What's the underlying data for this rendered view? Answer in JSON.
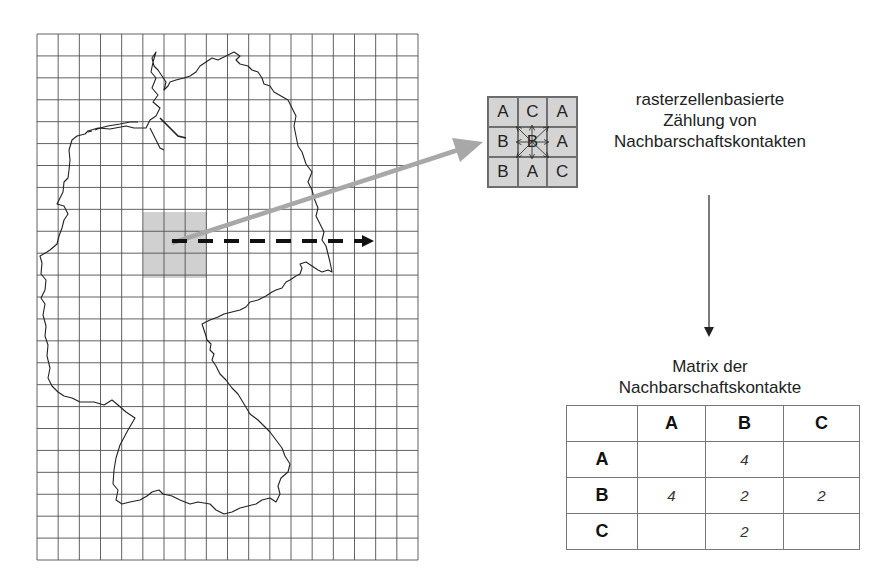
{
  "diagram": {
    "map": {
      "region": "Germany",
      "grid": {
        "columns": 18,
        "rows": 24,
        "line_color": "#555555"
      },
      "highlighted_block": {
        "columns": 3,
        "rows": 3,
        "fill": "#d0d0d0"
      },
      "scan_arrow": {
        "style": "dashed",
        "direction": "right",
        "color": "#111111"
      },
      "zoom_arrow": {
        "color": "#a8a8a8"
      }
    },
    "neighborhood": {
      "cells": [
        [
          "A",
          "C",
          "A"
        ],
        [
          "B",
          "B",
          "A"
        ],
        [
          "B",
          "A",
          "C"
        ]
      ],
      "fill": "#d4d4d4"
    },
    "counting_label": {
      "lines": [
        "rasterzellenbasierte",
        "Zählung von",
        "Nachbarschaftskontakten"
      ]
    },
    "matrix_label": {
      "lines": [
        "Matrix der",
        "Nachbarschaftskontakte"
      ]
    },
    "matrix": {
      "columns": [
        "",
        "A",
        "B",
        "C"
      ],
      "rows": [
        {
          "label": "A",
          "values": [
            "",
            "4",
            ""
          ]
        },
        {
          "label": "B",
          "values": [
            "4",
            "2",
            "2"
          ]
        },
        {
          "label": "C",
          "values": [
            "",
            "2",
            ""
          ]
        }
      ]
    }
  }
}
